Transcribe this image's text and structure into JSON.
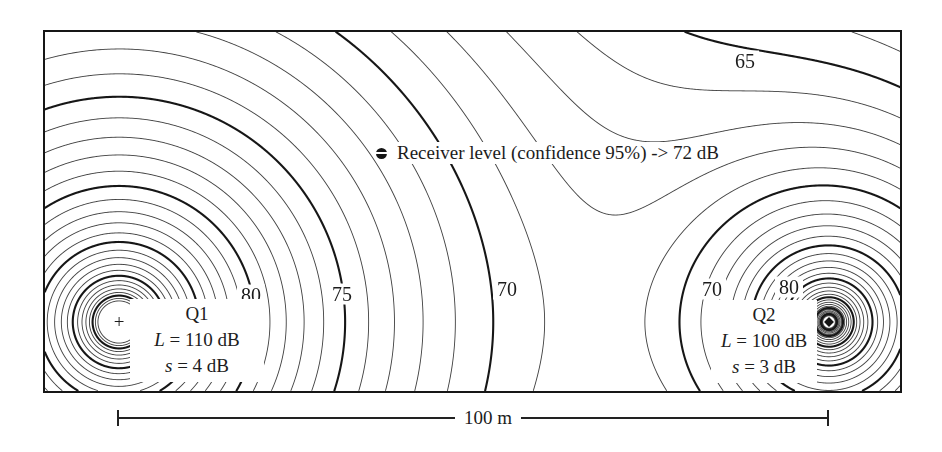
{
  "colors": {
    "background": "#ffffff",
    "ink": "#1c1c1c",
    "minor_contour_line": "#3f3f3f",
    "major_contour_line": "#161616"
  },
  "chart_data": {
    "type": "contour",
    "title": "",
    "unit": "dB",
    "sources": [
      {
        "name": "Q1",
        "marker": "+",
        "level_label_var": "L",
        "level_label_rest": " = 110 dB",
        "sigma_label_var": "s",
        "sigma_label_rest": " = 4 dB",
        "x_px": 119,
        "y_px": 322,
        "A_eff_dB": 106.6
      },
      {
        "name": "Q2",
        "marker": "diamond",
        "level_label_var": "L",
        "level_label_rest": " = 100 dB",
        "sigma_label_var": "s",
        "sigma_label_rest": " = 3 dB",
        "x_px": 829,
        "y_px": 322,
        "A_eff_dB": 96.0
      }
    ],
    "receiver": {
      "label": "Receiver level (confidence 95%) -> 72 dB",
      "level_dB": 72,
      "x_px": 382,
      "y_px": 153
    },
    "contours": {
      "min_dB": 64,
      "max_dB": 97,
      "step_dB": 1,
      "major_every_dB": 5
    },
    "contour_labels": [
      {
        "value": "80",
        "x_px": 251,
        "y_px": 295
      },
      {
        "value": "75",
        "x_px": 342,
        "y_px": 294
      },
      {
        "value": "70",
        "x_px": 507,
        "y_px": 289
      },
      {
        "value": "70",
        "x_px": 712,
        "y_px": 289
      },
      {
        "value": "80",
        "x_px": 789,
        "y_px": 287
      },
      {
        "value": "65",
        "x_px": 745,
        "y_px": 61
      }
    ],
    "scale_bar": {
      "label": "100 m",
      "length_m": 100,
      "x0_px": 118,
      "x1_px": 828,
      "y_px": 418,
      "label_x_px": 488
    },
    "field_model": {
      "geometric_decay_dB_per_distance_decade": 20,
      "air_absorption_dB_per_m": 0.05
    },
    "plot_frame_px": {
      "left": 43,
      "top": 30,
      "width": 859,
      "height": 363
    }
  }
}
